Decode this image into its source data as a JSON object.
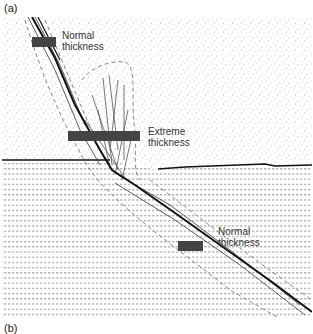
{
  "figure": {
    "panel_a_label": "(a)",
    "panel_b_label": "(b)",
    "annotations": [
      {
        "id": "normal-top",
        "line1": "Normal",
        "line2": "thickness"
      },
      {
        "id": "extreme",
        "line1": "Extreme",
        "line2": "thickness"
      },
      {
        "id": "normal-bottom",
        "line1": "Normal",
        "line2": "thickness"
      }
    ],
    "colors": {
      "fault_line": "#111111",
      "thickness_bar": "#444444",
      "stipple": "#9a9a9a",
      "lamination": "#8a8a8a",
      "damage_zone_dashed": "#888888"
    },
    "layers": {
      "upper": "stippled (sandstone)",
      "lower": "horizontally laminated"
    }
  }
}
